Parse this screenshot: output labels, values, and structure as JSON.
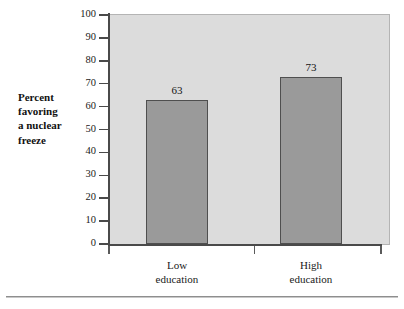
{
  "chart_data": {
    "type": "bar",
    "title": "",
    "xlabel": "",
    "ylabel": "Percent favoring a nuclear freeze",
    "ylim": [
      0,
      100
    ],
    "ytick_labels": [
      "100",
      "90",
      "80",
      "70",
      "60",
      "50",
      "40",
      "30",
      "20",
      "10",
      "0"
    ],
    "ytick_values": [
      100,
      90,
      80,
      70,
      60,
      50,
      40,
      30,
      20,
      10,
      0
    ],
    "grid": false,
    "legend": "none",
    "categories": [
      "Low education",
      "High education"
    ],
    "values": [
      63,
      73
    ],
    "data_labels": [
      "63",
      "73"
    ],
    "bars": [
      {
        "category_line1": "Low",
        "category_line2": "education",
        "value": 63,
        "label": "63"
      },
      {
        "category_line1": "High",
        "category_line2": "education",
        "value": 73,
        "label": "73"
      }
    ]
  },
  "axis_label": {
    "line1": "Percent",
    "line2": "favoring",
    "line3": "a nuclear",
    "line4": "freeze"
  },
  "colors": {
    "plot_background": "#dcdcdc",
    "bar_fill": "#9a9a9a",
    "bar_border": "#4f4f4f",
    "axis_line": "#4a4a4a",
    "page_background": "#ffffff"
  }
}
